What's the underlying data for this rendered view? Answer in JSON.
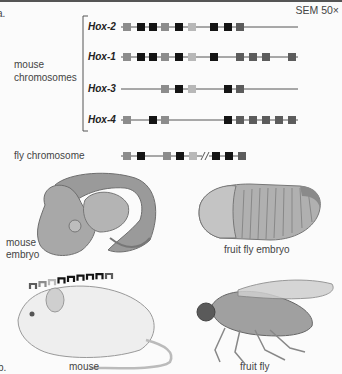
{
  "panel_labels": {
    "a": "a.",
    "b": "b."
  },
  "magnification": "SEM 50×",
  "group_label": "mouse\nchromosomes",
  "group_label_lines": [
    "mouse",
    "chromosomes"
  ],
  "colors": {
    "med": "#8c8c8c",
    "blk": "#141414",
    "lt": "#b8b8b8",
    "dk": "#5c5c5c",
    "line": "#555555"
  },
  "chromosomes": [
    {
      "name": "Hox-2",
      "genes": [
        "med",
        "blk",
        "blk",
        "med",
        "blk",
        "lt",
        null,
        "blk",
        "blk",
        "dk",
        null,
        null,
        null,
        null
      ]
    },
    {
      "name": "Hox-1",
      "genes": [
        "med",
        "blk",
        "blk",
        "med",
        "blk",
        "lt",
        null,
        "blk",
        null,
        "dk",
        "dk",
        "dk",
        null,
        "dk"
      ]
    },
    {
      "name": "Hox-3",
      "genes": [
        null,
        null,
        null,
        "med",
        "blk",
        "lt",
        null,
        null,
        "blk",
        "dk",
        null,
        null,
        null,
        null
      ]
    },
    {
      "name": "Hox-4",
      "genes": [
        "med",
        null,
        "blk",
        "med",
        null,
        null,
        null,
        null,
        "blk",
        "dk",
        "dk",
        "dk",
        "dk",
        "dk"
      ]
    }
  ],
  "fly": {
    "label": "fly chromosome",
    "genes_before_break": [
      "med",
      "blk",
      null,
      "med",
      "blk",
      "lt"
    ],
    "genes_after_break": [
      "blk",
      "blk",
      "dk"
    ],
    "break_symbol": "//"
  },
  "images": {
    "mouse_embryo_label": [
      "mouse",
      "embryo"
    ],
    "fly_embryo_label": "fruit fly embryo",
    "mouse_label": "mouse",
    "fly_label": "fruit fly"
  },
  "mouse_backbone_genes": [
    "dk",
    "med",
    "lt",
    "blk",
    "blk",
    "blk",
    "blk",
    "blk",
    "dk"
  ]
}
